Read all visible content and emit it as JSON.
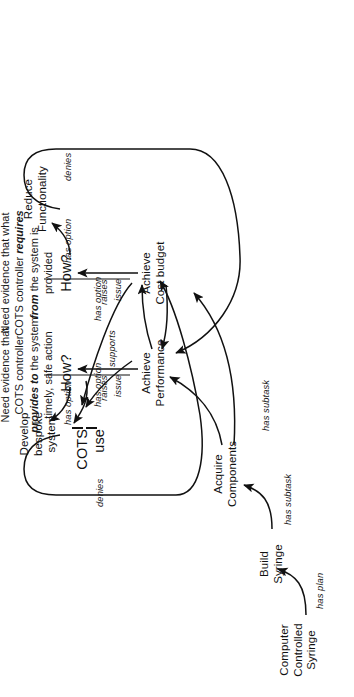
{
  "diagram": {
    "orientation": "rotated-90-ccw",
    "nodes": {
      "root": "Computer\nControlled\nSyringe",
      "build": "Build\nSyringe",
      "acquire": "Acquire\nComponents",
      "perf": "Achieve\nPerformance",
      "cost": "Achieve\nCost budget",
      "how_left": "How?",
      "how_right": "How?",
      "cots": "COTS use",
      "bespoke": "Develop\nbespoke\nsystem",
      "reduce": "Reduce\nFunctionality",
      "evidence_provides_pre": "Need evidence that\nCOTS controller",
      "evidence_provides_bold": "provides to",
      "evidence_provides_post": " the system\ntimely, safe action",
      "evidence_requires_pre": "Need evidence that what\nCOTS controller ",
      "evidence_requires_bold1": "requires",
      "evidence_requires_mid": "\n",
      "evidence_requires_bold2": "from",
      "evidence_requires_post": " the system is\nprovided"
    },
    "edge_labels": {
      "has_plan": "has plan",
      "has_subtask_1": "has subtask",
      "has_subtask_2": "has subtask",
      "raises_issue_left_a": "raises",
      "raises_issue_left_b": "issue",
      "raises_issue_right_a": "raises",
      "raises_issue_right_b": "issue",
      "has_option_bespoke": "has option",
      "has_option_cots_left": "has option",
      "has_option_cots_right": "has option",
      "has_option_reduce": "has option",
      "supports": "supports",
      "denies_left": "denies",
      "denies_right": "denies"
    },
    "colors": {
      "ink": "#111111",
      "background": "#ffffff"
    }
  }
}
